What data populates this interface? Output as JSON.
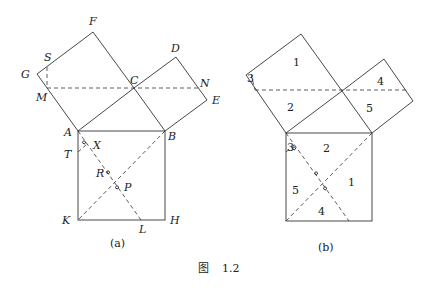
{
  "figure": {
    "caption_prefix": "图",
    "caption_number": "1.2",
    "panel_a": {
      "caption": "(a)",
      "labels": {
        "F": "F",
        "S": "S",
        "G": "G",
        "M": "M",
        "C": "C",
        "D": "D",
        "N": "N",
        "E": "E",
        "A": "A",
        "B": "B",
        "T": "T",
        "X": "X",
        "R": "R",
        "P": "P",
        "K": "K",
        "L": "L",
        "H": "H"
      }
    },
    "panel_b": {
      "caption": "(b)",
      "top_left_square": [
        "1",
        "2",
        "3"
      ],
      "top_right_square": [
        "4",
        "5"
      ],
      "bottom_square": [
        "2",
        "1",
        "5",
        "4",
        "3"
      ]
    }
  }
}
